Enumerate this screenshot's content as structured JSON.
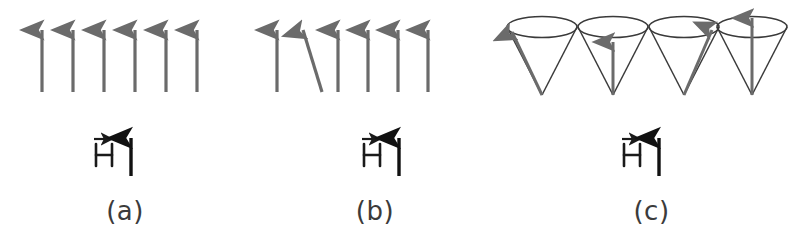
{
  "figure": {
    "background_color": "#ffffff",
    "width": 803,
    "height": 248
  },
  "colors": {
    "spin_arrow": "#6b6b6b",
    "spin_arrow_light": "#8a8a8a",
    "cone_outline": "#3a3a3a",
    "field_arrow": "#111111",
    "caption_text": "#3b3b3b",
    "label_text": "#1a1a1a"
  },
  "field_label": {
    "symbol": "H",
    "vector_accent": "→",
    "arrow_glyph": "↑",
    "meaning": "applied magnetic field vector H"
  },
  "panels": [
    {
      "id": "a",
      "caption": "(a)",
      "description": "ferromagnetic ground state, all spins aligned parallel to H",
      "type": "arrows",
      "spins": [
        {
          "index": 1,
          "x": 42,
          "tilt_deg": 0
        },
        {
          "index": 2,
          "x": 73,
          "tilt_deg": 0
        },
        {
          "index": 3,
          "x": 104,
          "tilt_deg": 0
        },
        {
          "index": 4,
          "x": 135,
          "tilt_deg": 0
        },
        {
          "index": 5,
          "x": 166,
          "tilt_deg": 0
        },
        {
          "index": 6,
          "x": 197,
          "tilt_deg": 0
        }
      ]
    },
    {
      "id": "b",
      "caption": "(b)",
      "description": "one deviated spin, a localized excitation relative to the aligned state",
      "type": "arrows",
      "spins": [
        {
          "index": 1,
          "x": 27,
          "tilt_deg": 0
        },
        {
          "index": 2,
          "x": 60,
          "tilt_deg": 17
        },
        {
          "index": 3,
          "x": 88,
          "tilt_deg": 0
        },
        {
          "index": 4,
          "x": 118,
          "tilt_deg": 0
        },
        {
          "index": 5,
          "x": 148,
          "tilt_deg": 0
        },
        {
          "index": 6,
          "x": 178,
          "tilt_deg": 0
        }
      ]
    },
    {
      "id": "c",
      "caption": "(c)",
      "description": "spin wave (magnon): spins precess on cones with successive phases",
      "type": "cones",
      "cones": [
        {
          "index": 1,
          "cx": 42,
          "phase_deg": 200,
          "phase_note": "arrow to upper-left rim"
        },
        {
          "index": 2,
          "cx": 113,
          "phase_deg": 270,
          "phase_note": "arrow to front of rim, appears vertical"
        },
        {
          "index": 3,
          "cx": 184,
          "phase_deg": 340,
          "phase_note": "arrow to upper-right rim"
        },
        {
          "index": 4,
          "cx": 252,
          "phase_deg": 90,
          "phase_note": "arrow to back of rim"
        }
      ]
    }
  ]
}
